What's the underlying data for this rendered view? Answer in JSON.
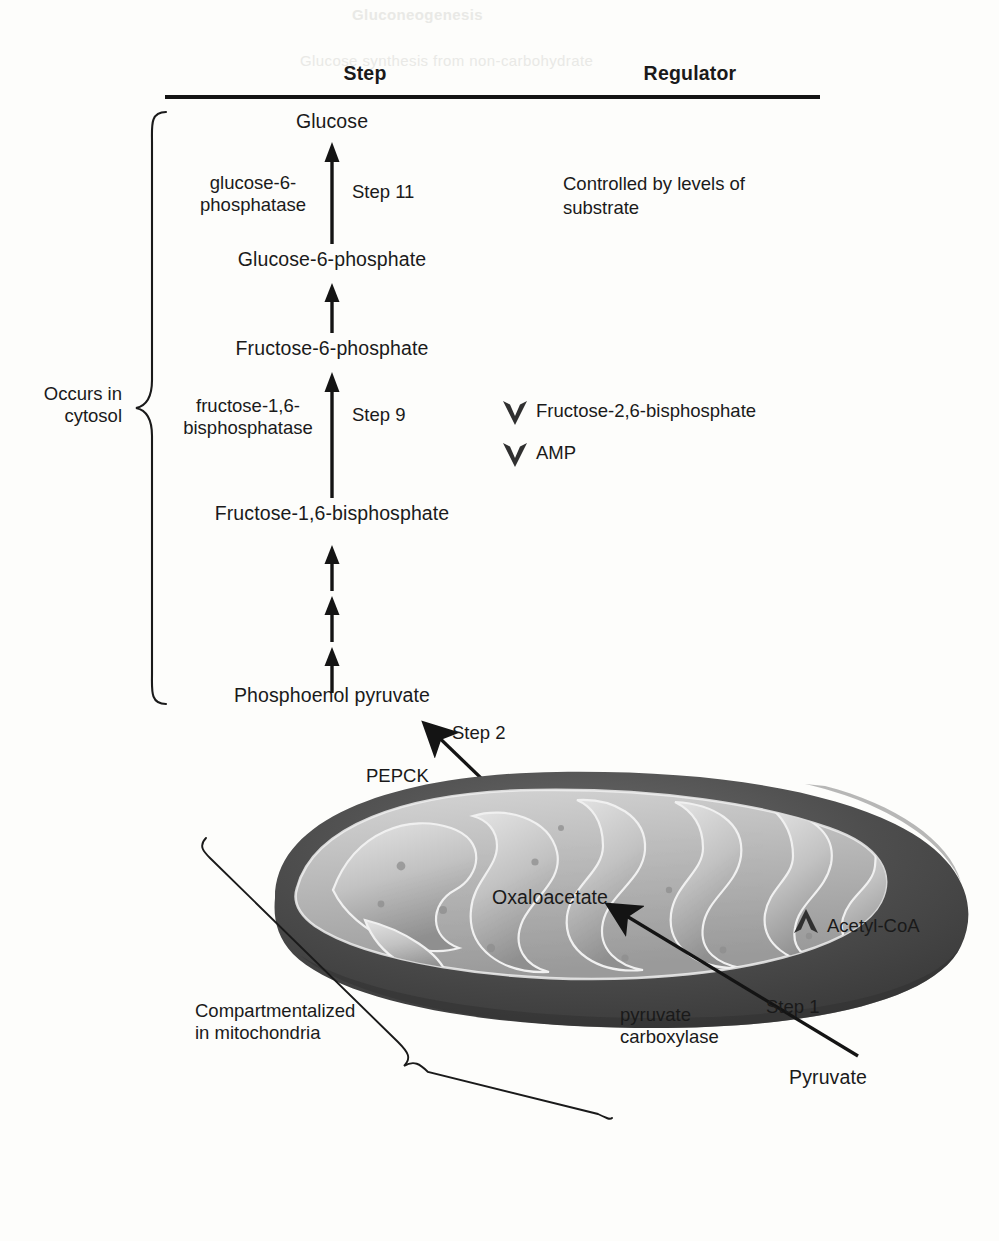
{
  "figure": {
    "headers": {
      "step": "Step",
      "regulator": "Regulator"
    },
    "ghost_text": {
      "top": "Gluconeogenesis",
      "sub": "Glucose synthesis from non-carbohydrate"
    }
  },
  "colors": {
    "ink": "#1a1a1a",
    "rule": "#141414",
    "mito_outer": "#4a4a4a",
    "mito_matrix": "#b9b9b9",
    "mito_crista_light": "#d8d8d8",
    "mito_crista_dark": "#8d8d8d",
    "ghost": "#e9e9e6",
    "page": "#fdfdfb"
  },
  "pathway": {
    "metabolites": [
      {
        "name": "Glucose",
        "y": 118
      },
      {
        "name": "Glucose-6-phosphate",
        "y": 256
      },
      {
        "name": "Fructose-6-phosphate",
        "y": 345
      },
      {
        "name": "Fructose-1,6-bisphosphate",
        "y": 510
      },
      {
        "name": "Phosphoenol pyruvate",
        "y": 692
      }
    ],
    "enzymes": [
      {
        "line1": "glucose-6-",
        "line2": "phosphatase",
        "y": 180
      },
      {
        "line1": "fructose-1,6-",
        "line2": "bisphosphatase",
        "y": 403
      }
    ],
    "steps": [
      {
        "label": "Step 11",
        "y": 190
      },
      {
        "label": "Step 9",
        "y": 413
      },
      {
        "label": "Step 2",
        "y": 731
      },
      {
        "label": "Step 1",
        "y": 1004
      }
    ]
  },
  "regulators": {
    "note": {
      "line1": "Controlled by levels of",
      "line2": "substrate"
    },
    "items": [
      {
        "label": "Fructose-2,6-bisphosphate",
        "marker": "chevron-down-icon",
        "y": 405
      },
      {
        "label": "AMP",
        "marker": "chevron-down-icon",
        "y": 447
      },
      {
        "label": "Acetyl-CoA",
        "marker": "chevron-up-icon",
        "y": 925
      }
    ]
  },
  "annotations": {
    "cytosol": {
      "line1": "Occurs in",
      "line2": "cytosol"
    },
    "mitochondria": {
      "line1": "Compartmentalized",
      "line2": "in mitochondria"
    },
    "pepck": "PEPCK",
    "pyruvate_carboxylase": {
      "line1": "pyruvate",
      "line2": "carboxylase"
    },
    "oxaloacetate": "Oxaloacetate",
    "pyruvate": "Pyruvate"
  }
}
